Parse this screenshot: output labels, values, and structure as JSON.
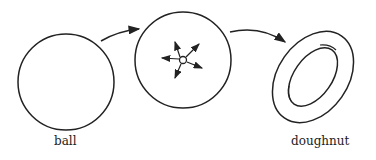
{
  "figure": {
    "shapes": [
      {
        "id": "ball",
        "label": "ball"
      },
      {
        "id": "punctured-ball",
        "label": ""
      },
      {
        "id": "doughnut",
        "label": "doughnut"
      }
    ],
    "stroke_color": "#222222"
  }
}
